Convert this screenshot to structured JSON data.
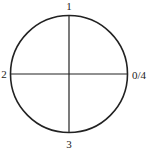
{
  "diagram": {
    "type": "circle-quadrants",
    "labels": {
      "top": "1",
      "left": "2",
      "bottom": "3",
      "right": "0/4"
    },
    "colors": {
      "stroke": "#222222",
      "background": "#ffffff"
    }
  }
}
